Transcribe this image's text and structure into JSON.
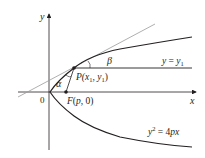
{
  "diagram": {
    "axes": {
      "x_label": "x",
      "y_label": "y",
      "origin_label": "0"
    },
    "point_p": {
      "label_prefix": "P(",
      "x": "x",
      "x_sub": "1",
      "sep": ", ",
      "y": "y",
      "y_sub": "1",
      "suffix": ")"
    },
    "focus": {
      "label": "F(p, 0)",
      "prefix": "F(",
      "p": "p",
      "rest": ", 0)"
    },
    "angles": {
      "alpha": "α",
      "beta": "β"
    },
    "line_label": {
      "lhs": "y",
      "eq": " = ",
      "rhs": "y",
      "sub": "1"
    },
    "curve_label": {
      "y": "y",
      "exp": "2",
      "eq": " = 4",
      "px": "px"
    },
    "colors": {
      "curve": "#231f20",
      "tangent": "#9a9a9a",
      "axis": "#231f20"
    }
  }
}
